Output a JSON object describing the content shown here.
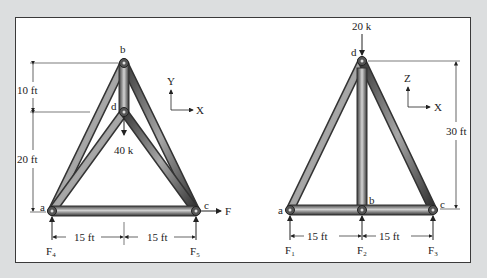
{
  "figure": {
    "left_truss": {
      "nodes": {
        "a": "a",
        "b": "b",
        "c": "c",
        "d": "d"
      },
      "load": "40 k",
      "applied_force": "F",
      "axes": {
        "vertical": "Y",
        "horizontal": "X"
      },
      "dimensions": {
        "upper_height": "10 ft",
        "lower_height": "20 ft",
        "left_span": "15 ft",
        "right_span": "15 ft"
      },
      "reactions": [
        {
          "base": "F",
          "sub": "4"
        },
        {
          "base": "F",
          "sub": "5"
        }
      ]
    },
    "right_truss": {
      "nodes": {
        "a": "a",
        "b": "b",
        "c": "c",
        "d": "d"
      },
      "load": "20 k",
      "axes": {
        "vertical": "Z",
        "horizontal": "X"
      },
      "dimensions": {
        "height": "30 ft",
        "left_span": "15 ft",
        "right_span": "15 ft"
      },
      "reactions": [
        {
          "base": "F",
          "sub": "1"
        },
        {
          "base": "F",
          "sub": "2"
        },
        {
          "base": "F",
          "sub": "3"
        }
      ]
    },
    "colors": {
      "background": "#dcdedf",
      "panel": "#ffffff",
      "member_dark": "#3c3c3c",
      "member_light": "#d8d8d8",
      "line": "#222222"
    }
  }
}
